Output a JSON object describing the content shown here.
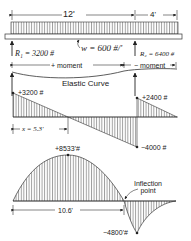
{
  "beam": {
    "span_main": "12'",
    "span_overhang": "4'",
    "load_label": "w = 600 #/'",
    "r1_label": "R₁ = 3200 #",
    "r2_label": "R₂ = 6400 #",
    "pos_moment": "+ moment",
    "neg_moment": "− moment",
    "elastic_curve": "Elastic Curve"
  },
  "shear": {
    "v_left": "+3200 #",
    "v_right_pos": "+2400 #",
    "v_right_neg": "−4000 #",
    "x_label": "x = 5.3'"
  },
  "moment": {
    "m_max": "+8533'#",
    "m_min": "−4800'#",
    "dist_label": "10.6'",
    "inflection": "Inflection point"
  },
  "colors": {
    "ink": "#222222",
    "hatch": "#444444"
  }
}
